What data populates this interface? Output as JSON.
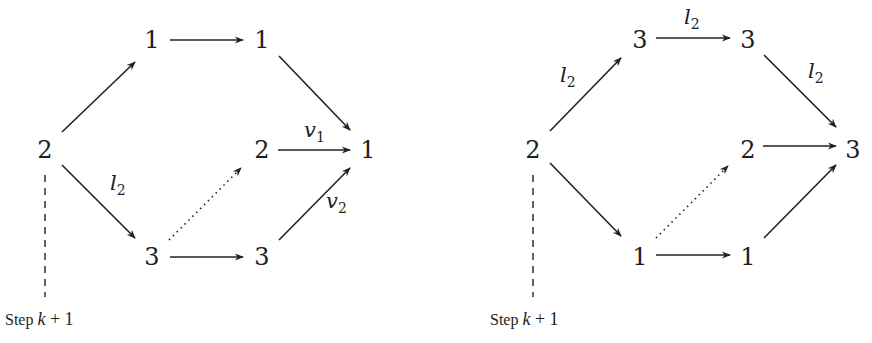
{
  "diagrams": [
    {
      "id": "left",
      "nodes": [
        {
          "id": "root",
          "label": "2",
          "x": 45,
          "y": 158
        },
        {
          "id": "top1",
          "label": "1",
          "x": 152,
          "y": 48
        },
        {
          "id": "top2",
          "label": "1",
          "x": 262,
          "y": 48
        },
        {
          "id": "mid",
          "label": "2",
          "x": 262,
          "y": 158
        },
        {
          "id": "sink",
          "label": "1",
          "x": 368,
          "y": 158
        },
        {
          "id": "bot1",
          "label": "3",
          "x": 152,
          "y": 265
        },
        {
          "id": "bot2",
          "label": "3",
          "x": 262,
          "y": 265
        }
      ],
      "edges": [
        {
          "from": "root",
          "to": "top1",
          "style": "solid",
          "x1": 62,
          "y1": 132,
          "x2": 135,
          "y2": 62
        },
        {
          "from": "top1",
          "to": "top2",
          "style": "solid",
          "x1": 170,
          "y1": 40,
          "x2": 243,
          "y2": 40
        },
        {
          "from": "top2",
          "to": "sink",
          "style": "solid",
          "x1": 279,
          "y1": 56,
          "x2": 350,
          "y2": 130
        },
        {
          "from": "root",
          "to": "bot1",
          "style": "solid",
          "x1": 62,
          "y1": 165,
          "x2": 135,
          "y2": 238,
          "label": "l",
          "sub": "2",
          "lx": 110,
          "ly": 190
        },
        {
          "from": "mid",
          "to": "sink",
          "style": "solid",
          "x1": 278,
          "y1": 150,
          "x2": 350,
          "y2": 150,
          "label": "v",
          "sub": "1",
          "lx": 304,
          "ly": 137
        },
        {
          "from": "bot1",
          "to": "bot2",
          "style": "solid",
          "x1": 170,
          "y1": 257,
          "x2": 243,
          "y2": 257
        },
        {
          "from": "bot2",
          "to": "sink",
          "style": "solid",
          "x1": 279,
          "y1": 240,
          "x2": 350,
          "y2": 168,
          "label": "v",
          "sub": "2",
          "lx": 326,
          "ly": 208
        },
        {
          "from": "bot1",
          "to": "mid",
          "style": "dotted",
          "x1": 169,
          "y1": 240,
          "x2": 241,
          "y2": 168
        }
      ],
      "step_marker": {
        "x": 45,
        "y1": 175,
        "y2": 297
      },
      "step_label": {
        "text": "Step",
        "var": "k",
        "rest": "+ 1",
        "x": 5,
        "y": 325
      }
    },
    {
      "id": "right",
      "nodes": [
        {
          "id": "root",
          "label": "2",
          "x": 533,
          "y": 158
        },
        {
          "id": "top1",
          "label": "3",
          "x": 640,
          "y": 48
        },
        {
          "id": "top2",
          "label": "3",
          "x": 748,
          "y": 48
        },
        {
          "id": "mid",
          "label": "2",
          "x": 748,
          "y": 158
        },
        {
          "id": "sink",
          "label": "3",
          "x": 853,
          "y": 158
        },
        {
          "id": "bot1",
          "label": "1",
          "x": 640,
          "y": 265
        },
        {
          "id": "bot2",
          "label": "1",
          "x": 748,
          "y": 265
        }
      ],
      "edges": [
        {
          "from": "root",
          "to": "top1",
          "style": "solid",
          "x1": 550,
          "y1": 131,
          "x2": 621,
          "y2": 58,
          "label": "l",
          "sub": "2",
          "lx": 560,
          "ly": 82
        },
        {
          "from": "top1",
          "to": "top2",
          "style": "solid",
          "x1": 656,
          "y1": 38,
          "x2": 730,
          "y2": 38,
          "label": "l",
          "sub": "2",
          "lx": 684,
          "ly": 24
        },
        {
          "from": "top2",
          "to": "sink",
          "style": "solid",
          "x1": 764,
          "y1": 55,
          "x2": 836,
          "y2": 127,
          "label": "l",
          "sub": "2",
          "lx": 808,
          "ly": 78
        },
        {
          "from": "root",
          "to": "bot1",
          "style": "solid",
          "x1": 550,
          "y1": 163,
          "x2": 621,
          "y2": 236
        },
        {
          "from": "mid",
          "to": "sink",
          "style": "solid",
          "x1": 763,
          "y1": 146,
          "x2": 836,
          "y2": 146
        },
        {
          "from": "bot1",
          "to": "bot2",
          "style": "solid",
          "x1": 656,
          "y1": 255,
          "x2": 730,
          "y2": 255
        },
        {
          "from": "bot2",
          "to": "sink",
          "style": "solid",
          "x1": 764,
          "y1": 238,
          "x2": 836,
          "y2": 165
        },
        {
          "from": "bot1",
          "to": "mid",
          "style": "dotted",
          "x1": 656,
          "y1": 238,
          "x2": 728,
          "y2": 166
        }
      ],
      "step_marker": {
        "x": 533,
        "y1": 175,
        "y2": 297
      },
      "step_label": {
        "text": "Step",
        "var": "k",
        "rest": "+ 1",
        "x": 490,
        "y": 325
      }
    }
  ]
}
